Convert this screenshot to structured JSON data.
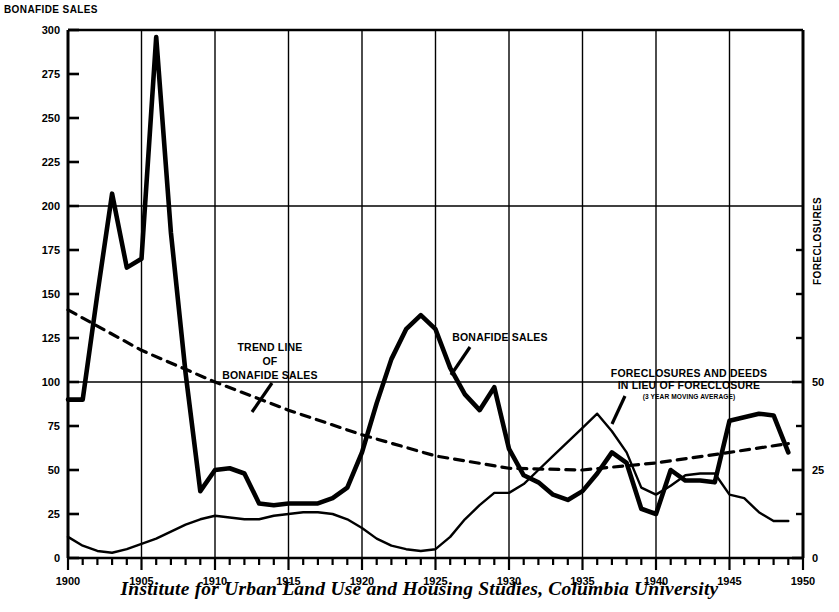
{
  "titles": {
    "left_axis": "BONAFIDE SALES",
    "right_axis": "FORECLOSURES",
    "caption": "Institute for Urban Land Use and Housing Studies, Columbia University"
  },
  "annotations": {
    "trend": {
      "line1": "TREND LINE",
      "line2": "OF",
      "line3": "BONAFIDE SALES"
    },
    "sales": {
      "line1": "BONAFIDE SALES"
    },
    "foreclosures": {
      "line1": "FORECLOSURES AND DEEDS",
      "line2": "IN LIEU OF FORECLOSURE",
      "line3": "(3 YEAR MOVING AVERAGE)"
    }
  },
  "colors": {
    "ink": "#000000",
    "background": "#ffffff"
  },
  "chart_data": {
    "type": "line",
    "title": "BONAFIDE SALES",
    "xlabel": "",
    "ylabel": "BONAFIDE SALES",
    "y2label": "FORECLOSURES",
    "xlim": [
      1900,
      1950
    ],
    "ylim": [
      0,
      300
    ],
    "y2lim": [
      0,
      150
    ],
    "grid": true,
    "grid_x_values": [
      1905,
      1910,
      1915,
      1920,
      1925,
      1930,
      1935,
      1940,
      1945,
      1950
    ],
    "grid_y_values": [
      100,
      200,
      300
    ],
    "xticks": [
      1900,
      1905,
      1910,
      1915,
      1920,
      1925,
      1930,
      1935,
      1940,
      1945,
      1950
    ],
    "xticklabels": [
      "1900",
      "1905",
      "1910",
      "1915",
      "1920",
      "1925",
      "1930",
      "1935",
      "1940",
      "1945",
      "1950"
    ],
    "xminorticks_every": 1,
    "yticks": [
      0,
      25,
      50,
      75,
      100,
      125,
      150,
      175,
      200,
      225,
      250,
      275,
      300
    ],
    "yticklabels": [
      "0",
      "25",
      "50",
      "75",
      "100",
      "125",
      "150",
      "175",
      "200",
      "225",
      "250",
      "275",
      "300"
    ],
    "y2ticks": [
      0,
      25,
      50
    ],
    "y2ticklabels": [
      "0",
      "25",
      "50"
    ],
    "y2tick_values_on_left_scale": [
      0,
      50,
      100
    ],
    "y2minorticks_on_left_scale": [
      25,
      75,
      125,
      150,
      175
    ],
    "legend": "none",
    "series": [
      {
        "name": "Bonafide Sales",
        "style": "solid-thick",
        "axis": "left",
        "x": [
          1900,
          1901,
          1902,
          1903,
          1904,
          1905,
          1906,
          1907,
          1908,
          1909,
          1910,
          1911,
          1912,
          1913,
          1914,
          1915,
          1916,
          1917,
          1918,
          1919,
          1920,
          1921,
          1922,
          1923,
          1924,
          1925,
          1926,
          1927,
          1928,
          1929,
          1930,
          1931,
          1932,
          1933,
          1934,
          1935,
          1936,
          1937,
          1938,
          1939,
          1940,
          1941,
          1942,
          1943,
          1944,
          1945,
          1946,
          1947,
          1948,
          1949
        ],
        "values": [
          90,
          90,
          150,
          207,
          165,
          170,
          296,
          185,
          105,
          38,
          50,
          51,
          48,
          31,
          30,
          31,
          31,
          31,
          34,
          40,
          60,
          88,
          113,
          130,
          138,
          130,
          108,
          93,
          84,
          97,
          62,
          47,
          43,
          36,
          33,
          38,
          48,
          60,
          54,
          28,
          25,
          50,
          44,
          44,
          43,
          78,
          80,
          82,
          81,
          60
        ]
      },
      {
        "name": "Foreclosures and Deeds in Lieu of Foreclosure (3 Year Moving Average)",
        "style": "solid-thin",
        "axis": "right",
        "x": [
          1900,
          1901,
          1902,
          1903,
          1904,
          1905,
          1906,
          1907,
          1908,
          1909,
          1910,
          1911,
          1912,
          1913,
          1914,
          1915,
          1916,
          1917,
          1918,
          1919,
          1920,
          1921,
          1922,
          1923,
          1924,
          1925,
          1926,
          1927,
          1928,
          1929,
          1930,
          1931,
          1932,
          1933,
          1934,
          1935,
          1936,
          1937,
          1938,
          1939,
          1940,
          1941,
          1942,
          1943,
          1944,
          1945,
          1946,
          1947,
          1948,
          1949
        ],
        "values_left_scale": [
          12,
          7,
          4,
          3,
          5,
          8,
          11,
          15,
          19,
          22,
          24,
          23,
          22,
          22,
          24,
          25,
          26,
          26,
          25,
          22,
          17,
          11,
          7,
          5,
          4,
          5,
          12,
          22,
          30,
          37,
          37,
          42,
          50,
          58,
          66,
          74,
          82,
          72,
          60,
          40,
          36,
          41,
          47,
          48,
          48,
          36,
          34,
          26,
          21,
          21
        ],
        "values_right_scale": [
          6,
          3.5,
          2,
          1.5,
          2.5,
          4,
          5.5,
          7.5,
          9.5,
          11,
          12,
          11.5,
          11,
          11,
          12,
          12.5,
          13,
          13,
          12.5,
          11,
          8.5,
          5.5,
          3.5,
          2.5,
          2,
          2.5,
          6,
          11,
          15,
          18.5,
          18.5,
          21,
          25,
          29,
          33,
          37,
          41,
          36,
          30,
          20,
          18,
          20.5,
          23.5,
          24,
          24,
          18,
          17,
          13,
          10.5,
          10.5
        ]
      },
      {
        "name": "Trend Line of Bonafide Sales",
        "style": "dashed",
        "axis": "left",
        "x": [
          1900,
          1905,
          1910,
          1915,
          1920,
          1925,
          1930,
          1935,
          1940,
          1945,
          1949
        ],
        "values": [
          141,
          118,
          100,
          84,
          70,
          58,
          51,
          50,
          54,
          60,
          65
        ]
      }
    ]
  }
}
